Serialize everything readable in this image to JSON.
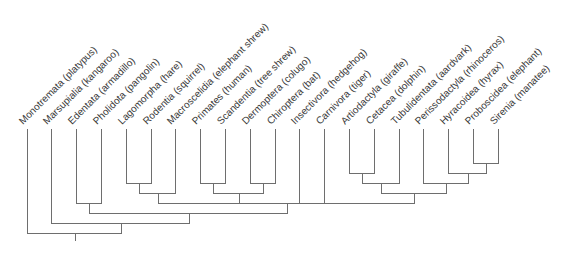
{
  "figure": {
    "type": "cladogram"
  },
  "cladogram": {
    "leaf_top_y": 129,
    "leaf_x_start": 26.5,
    "leaf_spacing": 24.8,
    "label_y": 125,
    "label_dx": -4.5,
    "label_angle": -45,
    "line_color": "#6e6e6e",
    "text_color": "#3a3a3a",
    "root_stem_bottom": 241,
    "leaves": [
      {
        "id": "monotremata",
        "label": "Monotremata (platypus)"
      },
      {
        "id": "marsupialia",
        "label": "Marsupialia (kangaroo)"
      },
      {
        "id": "edentata",
        "label": "Edentata (armadillo)"
      },
      {
        "id": "pholidota",
        "label": "Pholidota (pangolin)"
      },
      {
        "id": "lagomorpha",
        "label": "Lagomorpha (hare)"
      },
      {
        "id": "rodentia",
        "label": "Rodentia (squirrel)"
      },
      {
        "id": "macroscelidia",
        "label": "Macroscelidia (elephant shrew)"
      },
      {
        "id": "primates",
        "label": "Primates (human)"
      },
      {
        "id": "scandentia",
        "label": "Scandentia (tree shrew)"
      },
      {
        "id": "dermoptera",
        "label": "Dermoptera (colugo)"
      },
      {
        "id": "chiroptera",
        "label": "Chiroptera (bat)"
      },
      {
        "id": "insectivora",
        "label": "Insectivora (hedgehog)"
      },
      {
        "id": "carnivora",
        "label": "Carnivora (tiger)"
      },
      {
        "id": "artiodactyla",
        "label": "Artiodactyla (giraffe)"
      },
      {
        "id": "cetacea",
        "label": "Cetacea (dolphin)"
      },
      {
        "id": "tubulidentata",
        "label": "Tubulidentata (aardvark)"
      },
      {
        "id": "perissodactyla",
        "label": "Perissodactyla (rhinoceros)"
      },
      {
        "id": "hyracoidea",
        "label": "Hyracoidea (hyrax)"
      },
      {
        "id": "proboscidea",
        "label": "Proboscidea (elephant)"
      },
      {
        "id": "sirenia",
        "label": "Sirenia (manatee)"
      }
    ],
    "nodes": [
      {
        "id": "n_lago_rod",
        "y": 183,
        "children": [
          "lagomorpha",
          "rodentia"
        ]
      },
      {
        "id": "n_glires_macro",
        "y": 193,
        "children": [
          "n_lago_rod",
          "macroscelidia"
        ]
      },
      {
        "id": "n_prim_scand",
        "y": 183,
        "children": [
          "primates",
          "scandentia"
        ]
      },
      {
        "id": "n_derm_chir",
        "y": 183,
        "children": [
          "dermoptera",
          "chiroptera"
        ]
      },
      {
        "id": "n_euarch_bats",
        "y": 193,
        "children": [
          "n_prim_scand",
          "n_derm_chir"
        ]
      },
      {
        "id": "n_artio_cet",
        "y": 173,
        "children": [
          "artiodactyla",
          "cetacea"
        ]
      },
      {
        "id": "n_artio_cet_tub",
        "y": 183,
        "children": [
          "n_artio_cet",
          "tubulidentata"
        ]
      },
      {
        "id": "n_prob_sir",
        "y": 163,
        "children": [
          "proboscidea",
          "sirenia"
        ]
      },
      {
        "id": "n_hyr_prob_sir",
        "y": 173,
        "children": [
          "hyracoidea",
          "n_prob_sir"
        ]
      },
      {
        "id": "n_peri_paen",
        "y": 183,
        "children": [
          "perissodactyla",
          "n_hyr_prob_sir"
        ]
      },
      {
        "id": "n_ungulates",
        "y": 193,
        "children": [
          "n_artio_cet_tub",
          "n_peri_paen"
        ]
      },
      {
        "id": "n_polytomy",
        "y": 203,
        "children": [
          "n_glires_macro",
          "n_euarch_bats",
          "insectivora",
          "carnivora",
          "n_ungulates"
        ]
      },
      {
        "id": "n_eden_phol",
        "y": 203,
        "children": [
          "edentata",
          "pholidota"
        ]
      },
      {
        "id": "n_eden_poly",
        "y": 213,
        "children": [
          "n_eden_phol",
          "n_polytomy"
        ]
      },
      {
        "id": "n_theria",
        "y": 223,
        "children": [
          "marsupialia",
          "n_eden_poly"
        ]
      },
      {
        "id": "n_root",
        "y": 233,
        "children": [
          "monotremata",
          "n_theria"
        ]
      }
    ]
  }
}
